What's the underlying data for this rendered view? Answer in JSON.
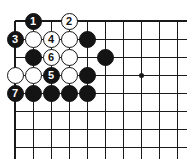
{
  "diagram": {
    "type": "go-board-problem",
    "board": {
      "columns": 10,
      "rows": 8,
      "origin_corner": "top-left",
      "grid_spacing_px": 18,
      "star_points": [
        {
          "col": 8,
          "row": 4
        }
      ],
      "line_color": "#1a1a1a",
      "background_color": "#ffffff"
    },
    "colors": {
      "black_stone": "#141414",
      "white_stone": "#ffffff",
      "black_label": "#ffffff",
      "white_label": "#141414"
    },
    "stones": [
      {
        "col": 2,
        "row": 1,
        "color": "black",
        "label": "1"
      },
      {
        "col": 4,
        "row": 1,
        "color": "white",
        "label": "2"
      },
      {
        "col": 1,
        "row": 2,
        "color": "black",
        "label": "3"
      },
      {
        "col": 2,
        "row": 2,
        "color": "white",
        "label": ""
      },
      {
        "col": 3,
        "row": 2,
        "color": "white",
        "label": "4"
      },
      {
        "col": 4,
        "row": 2,
        "color": "white",
        "label": ""
      },
      {
        "col": 5,
        "row": 2,
        "color": "black",
        "label": ""
      },
      {
        "col": 2,
        "row": 3,
        "color": "black",
        "label": ""
      },
      {
        "col": 3,
        "row": 3,
        "color": "white",
        "label": "6"
      },
      {
        "col": 4,
        "row": 3,
        "color": "white",
        "label": ""
      },
      {
        "col": 6,
        "row": 3,
        "color": "black",
        "label": ""
      },
      {
        "col": 1,
        "row": 4,
        "color": "white",
        "label": ""
      },
      {
        "col": 2,
        "row": 4,
        "color": "white",
        "label": ""
      },
      {
        "col": 3,
        "row": 4,
        "color": "black",
        "label": "5"
      },
      {
        "col": 4,
        "row": 4,
        "color": "white",
        "label": ""
      },
      {
        "col": 5,
        "row": 4,
        "color": "black",
        "label": ""
      },
      {
        "col": 1,
        "row": 5,
        "color": "black",
        "label": "7"
      },
      {
        "col": 2,
        "row": 5,
        "color": "black",
        "label": ""
      },
      {
        "col": 3,
        "row": 5,
        "color": "black",
        "label": ""
      },
      {
        "col": 4,
        "row": 5,
        "color": "black",
        "label": ""
      },
      {
        "col": 5,
        "row": 5,
        "color": "black",
        "label": ""
      }
    ]
  }
}
